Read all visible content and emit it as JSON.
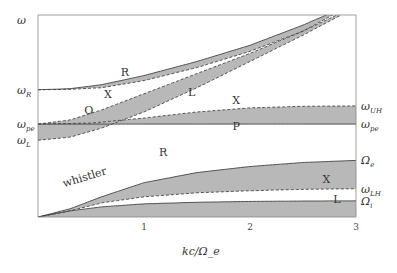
{
  "chart_data": {
    "type": "area",
    "title": "",
    "xlabel": "kc/Ω_e",
    "ylabel": "ω",
    "xlim": [
      0,
      3
    ],
    "x_ticks": [
      "1",
      "2",
      "3"
    ],
    "y_level_labels": {
      "left": [
        {
          "key": "omega_R",
          "text": "ω",
          "sub": "R"
        },
        {
          "key": "omega_pe",
          "text": "ω",
          "sub": "pe"
        },
        {
          "key": "omega_L",
          "text": "ω",
          "sub": "L"
        }
      ],
      "right": [
        {
          "key": "omega_UH",
          "text": "ω",
          "sub": "UH"
        },
        {
          "key": "omega_pe",
          "text": "ω",
          "sub": "pe"
        },
        {
          "key": "Omega_e",
          "text": "Ω",
          "sub": "e"
        },
        {
          "key": "omega_LH",
          "text": "ω",
          "sub": "LH"
        },
        {
          "key": "Omega_i",
          "text": "Ω",
          "sub": "i"
        }
      ]
    },
    "levels": {
      "omega_R": 0.63,
      "omega_pe": 0.46,
      "omega_L": 0.38,
      "omega_UH": 0.55,
      "Omega_e": 0.28,
      "omega_LH": 0.14,
      "Omega_i": 0.08,
      "top": 1.0
    },
    "band_labels": [
      {
        "text": "R",
        "x": 0.82,
        "y": 0.7
      },
      {
        "text": "X",
        "x": 0.66,
        "y": 0.59
      },
      {
        "text": "O",
        "x": 0.48,
        "y": 0.51
      },
      {
        "text": "L",
        "x": 1.45,
        "y": 0.6
      },
      {
        "text": "X",
        "x": 1.87,
        "y": 0.56
      },
      {
        "text": "P",
        "x": 1.87,
        "y": 0.43
      },
      {
        "text": "R",
        "x": 1.18,
        "y": 0.3
      },
      {
        "text": "X",
        "x": 2.72,
        "y": 0.17
      },
      {
        "text": "L",
        "x": 2.82,
        "y": 0.07
      },
      {
        "text": "whistler",
        "x": 0.45,
        "y": 0.18,
        "rotate": -17
      }
    ],
    "series": [
      {
        "name": "R upper",
        "x": [
          0,
          0.3,
          0.6,
          1.0,
          1.5,
          2.0,
          2.5,
          2.72
        ],
        "y": [
          0.63,
          0.635,
          0.655,
          0.7,
          0.77,
          0.85,
          0.95,
          1.0
        ]
      },
      {
        "name": "X lower (R band)",
        "x": [
          0,
          0.3,
          0.6,
          1.0,
          1.5,
          2.0,
          2.5,
          2.78
        ],
        "y": [
          0.63,
          0.632,
          0.64,
          0.675,
          0.74,
          0.82,
          0.92,
          1.0
        ]
      },
      {
        "name": "O upper",
        "x": [
          0,
          0.3,
          0.6,
          1.0,
          1.5,
          2.0,
          2.5,
          2.82
        ],
        "y": [
          0.46,
          0.48,
          0.53,
          0.61,
          0.71,
          0.81,
          0.92,
          1.0
        ]
      },
      {
        "name": "L lower",
        "x": [
          0,
          0.3,
          0.6,
          1.0,
          1.5,
          2.0,
          2.5,
          2.86
        ],
        "y": [
          0.38,
          0.395,
          0.44,
          0.52,
          0.64,
          0.77,
          0.9,
          1.0
        ]
      },
      {
        "name": "X upper (UH)",
        "x": [
          0,
          0.5,
          1.0,
          1.5,
          2.0,
          2.5,
          3.0
        ],
        "y": [
          0.46,
          0.465,
          0.49,
          0.52,
          0.54,
          0.548,
          0.55
        ]
      },
      {
        "name": "P (omega_pe)",
        "x": [
          0,
          3.0
        ],
        "y": [
          0.46,
          0.46
        ]
      },
      {
        "name": "R whistler upper",
        "x": [
          0,
          0.3,
          0.6,
          1.0,
          1.5,
          2.0,
          2.5,
          3.0
        ],
        "y": [
          0.0,
          0.04,
          0.1,
          0.17,
          0.22,
          0.25,
          0.27,
          0.28
        ]
      },
      {
        "name": "X whistler lower (LH)",
        "x": [
          0,
          0.3,
          0.6,
          1.0,
          1.5,
          2.0,
          2.5,
          3.0
        ],
        "y": [
          0.0,
          0.03,
          0.07,
          0.1,
          0.12,
          0.13,
          0.137,
          0.14
        ]
      },
      {
        "name": "L ion upper",
        "x": [
          0,
          0.3,
          0.6,
          1.0,
          1.5,
          2.0,
          2.5,
          3.0
        ],
        "y": [
          0.0,
          0.03,
          0.05,
          0.065,
          0.073,
          0.077,
          0.079,
          0.08
        ]
      }
    ],
    "shaded_bands": [
      {
        "name": "R-X band",
        "upper": "R upper",
        "lower": "X lower (R band)"
      },
      {
        "name": "O-L band",
        "upper": "O upper",
        "lower": "L lower"
      },
      {
        "name": "X-P band",
        "upper": "X upper (UH)",
        "lower": "P (omega_pe)"
      },
      {
        "name": "whistler R-X band",
        "upper": "R whistler upper",
        "lower": "X whistler lower (LH)"
      },
      {
        "name": "ion L band",
        "upper": "L ion upper",
        "lower": "zero"
      }
    ],
    "dashed_series": [
      "X lower (R band)",
      "O upper",
      "L lower",
      "X upper (UH)",
      "X whistler lower (LH)"
    ],
    "grid": false,
    "legend": "none"
  }
}
